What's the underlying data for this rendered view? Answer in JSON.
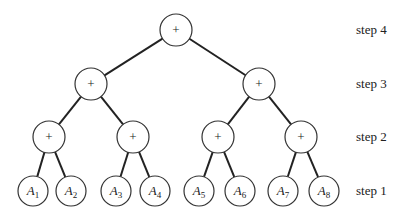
{
  "diagram": {
    "type": "binary-tree-reduction",
    "operator_symbol": "+",
    "levels": [
      {
        "label": "step 4",
        "y": 30,
        "nodes": [
          {
            "x": 176,
            "label": "+"
          }
        ]
      },
      {
        "label": "step 3",
        "y": 84,
        "nodes": [
          {
            "x": 91,
            "label": "+"
          },
          {
            "x": 259,
            "label": "+"
          }
        ]
      },
      {
        "label": "step 2",
        "y": 137,
        "nodes": [
          {
            "x": 49,
            "label": "+"
          },
          {
            "x": 133,
            "label": "+"
          },
          {
            "x": 218,
            "label": "+"
          },
          {
            "x": 301,
            "label": "+"
          }
        ]
      },
      {
        "label": "step 1",
        "y": 191,
        "nodes": [
          {
            "x": 33,
            "var": "A",
            "sub": "1"
          },
          {
            "x": 71,
            "var": "A",
            "sub": "2"
          },
          {
            "x": 116,
            "var": "A",
            "sub": "3"
          },
          {
            "x": 155,
            "var": "A",
            "sub": "4"
          },
          {
            "x": 199,
            "var": "A",
            "sub": "5"
          },
          {
            "x": 240,
            "var": "A",
            "sub": "6"
          },
          {
            "x": 283,
            "var": "A",
            "sub": "7"
          },
          {
            "x": 324,
            "var": "A",
            "sub": "8"
          }
        ]
      }
    ],
    "step_labels": [
      "step 4",
      "step 3",
      "step 2",
      "step 1"
    ]
  }
}
